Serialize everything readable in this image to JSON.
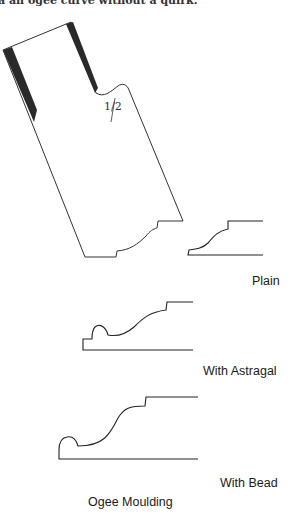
{
  "page": {
    "top_text": "a an ogee curve without a quirk."
  },
  "plane_iron": {
    "scale_label": "1/2"
  },
  "mouldings": [
    {
      "name": "plain",
      "label": "Plain"
    },
    {
      "name": "with-astragal",
      "label": "With Astragal"
    },
    {
      "name": "with-bead",
      "label": "With Bead"
    }
  ],
  "figure_title": "Ogee Moulding"
}
